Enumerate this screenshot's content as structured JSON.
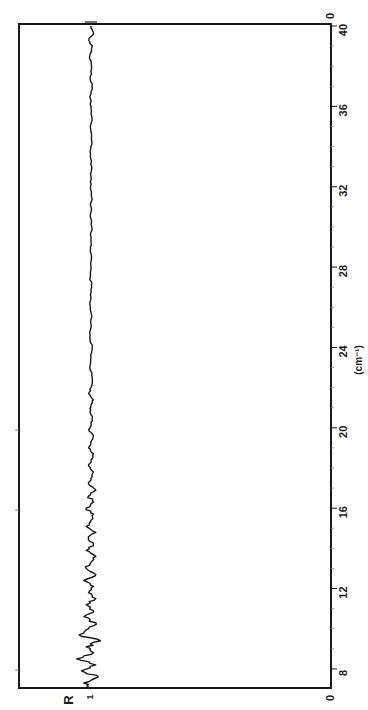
{
  "chart_data": {
    "type": "line",
    "orientation": "rotated-90-clockwise",
    "title": "",
    "xlabel": "(cm⁻¹)",
    "ylabel": "R",
    "xlim": [
      7,
      40
    ],
    "ylim": [
      0,
      1.3
    ],
    "x_ticks": [
      8,
      12,
      16,
      20,
      24,
      28,
      32,
      36,
      40
    ],
    "y_ticks": [
      0,
      1
    ],
    "y_tick_labels": [
      "0",
      "1"
    ],
    "grid": false,
    "legend": null,
    "series": [
      {
        "name": "R",
        "x": [
          7.0,
          7.3,
          7.6,
          7.9,
          8.2,
          8.5,
          8.8,
          9.1,
          9.4,
          9.7,
          10.0,
          10.3,
          10.6,
          10.9,
          11.2,
          11.5,
          11.8,
          12.1,
          12.4,
          12.7,
          13.0,
          13.3,
          13.6,
          13.9,
          14.2,
          14.5,
          14.8,
          15.1,
          15.4,
          15.7,
          16.0,
          16.3,
          16.6,
          16.9,
          17.2,
          17.5,
          17.8,
          18.1,
          18.4,
          18.7,
          19.0,
          19.3,
          19.6,
          19.9,
          20.2,
          20.5,
          20.8,
          21.1,
          21.4,
          21.7,
          22.0,
          22.5,
          23.0,
          23.5,
          24.0,
          24.5,
          25.0,
          25.5,
          26.0,
          26.5,
          27.0,
          27.5,
          28.0,
          28.5,
          29.0,
          29.5,
          30.0,
          30.5,
          31.0,
          31.5,
          32.0,
          32.5,
          33.0,
          33.5,
          34.0,
          34.5,
          35.0,
          35.5,
          36.0,
          36.5,
          37.0,
          37.5,
          38.0,
          38.5,
          39.0,
          39.3,
          39.6,
          39.9
        ],
        "values": [
          1.0,
          1.03,
          0.97,
          1.04,
          0.98,
          1.06,
          0.99,
          1.02,
          0.96,
          1.05,
          1.01,
          0.98,
          1.03,
          0.99,
          1.02,
          0.98,
          1.01,
          0.99,
          1.03,
          0.98,
          1.02,
          1.0,
          0.98,
          1.02,
          0.99,
          1.01,
          0.98,
          1.02,
          1.0,
          0.99,
          1.02,
          0.99,
          1.01,
          0.98,
          1.01,
          1.0,
          0.99,
          1.01,
          1.0,
          0.99,
          1.01,
          1.0,
          0.99,
          1.01,
          1.0,
          0.995,
          1.005,
          1.0,
          0.99,
          1.01,
          1.0,
          0.995,
          1.005,
          1.0,
          0.995,
          1.005,
          1.0,
          0.997,
          1.003,
          1.0,
          0.997,
          1.003,
          1.0,
          0.998,
          1.002,
          1.0,
          0.997,
          1.003,
          1.0,
          0.998,
          1.002,
          1.0,
          0.997,
          1.003,
          1.0,
          0.998,
          1.003,
          0.997,
          1.0,
          1.004,
          0.996,
          1.003,
          0.998,
          1.006,
          0.994,
          1.01,
          0.99,
          1.0
        ]
      }
    ]
  },
  "axis_labels": {
    "wavenumber_unit": "(cm⁻¹)",
    "r_axis": "R",
    "r_one": "1",
    "r_zero_top": "0",
    "r_zero_bottom": "0"
  },
  "tick_labels": [
    "8",
    "12",
    "16",
    "20",
    "24",
    "28",
    "32",
    "36",
    "40"
  ],
  "colors": {
    "ink": "#1a1a1a",
    "background": "#ffffff"
  }
}
